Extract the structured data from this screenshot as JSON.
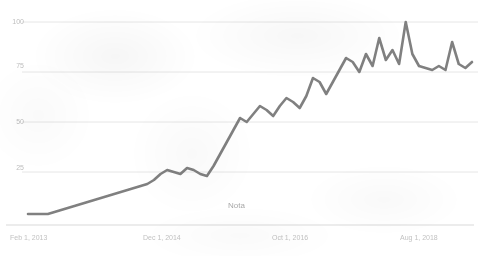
{
  "chart_data": {
    "type": "line",
    "title": "",
    "subtitle": "",
    "xlabel": "",
    "ylabel": "",
    "ylim": [
      0,
      100
    ],
    "grid": true,
    "gridlines_y": [
      25,
      50,
      75,
      100
    ],
    "legend": null,
    "legend_position": "none",
    "annotations": [
      {
        "text": "Nota",
        "x_frac": 0.5,
        "y_value": 8
      }
    ],
    "series_color": "#6e6e6e",
    "grid_color": "#e3e3e3",
    "axis_label_color": "#bdbdbd",
    "background_color": "#ffffff",
    "y_tick_labels": [
      "100",
      "75",
      "50",
      "25"
    ],
    "y_tick_values": [
      100,
      75,
      50,
      25
    ],
    "x_tick_labels": [
      "Feb 1, 2013",
      "Dec 1, 2014",
      "Oct 1, 2016",
      "Aug 1, 2018"
    ],
    "x_tick_index": [
      0,
      22,
      44,
      66
    ],
    "x_start": "Feb 1, 2013",
    "x_end": "Aug 1, 2018",
    "x_unit": "month",
    "n_points": 68,
    "values": [
      4,
      4,
      4,
      4,
      5,
      6,
      7,
      8,
      9,
      10,
      11,
      12,
      13,
      14,
      15,
      16,
      17,
      18,
      19,
      21,
      24,
      26,
      25,
      24,
      27,
      26,
      24,
      23,
      28,
      34,
      40,
      46,
      52,
      50,
      54,
      58,
      56,
      53,
      58,
      62,
      60,
      57,
      63,
      72,
      70,
      64,
      70,
      76,
      82,
      80,
      75,
      84,
      78,
      92,
      81,
      86,
      79,
      100,
      84,
      78,
      77,
      76,
      78,
      76,
      90,
      79,
      77,
      80
    ]
  }
}
